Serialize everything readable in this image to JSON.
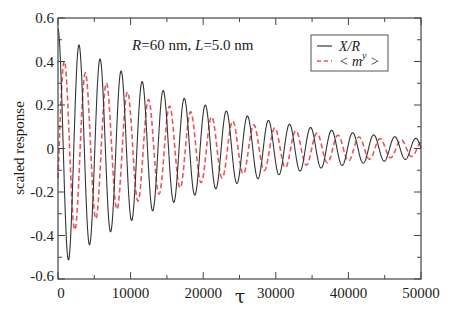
{
  "chart_data": {
    "type": "line",
    "title": "",
    "annotation": "R=60 nm, L=5.0 nm",
    "annotation_parts": {
      "r_label": "R",
      "r_value": "=60 nm, ",
      "l_label": "L",
      "l_value": "=5.0 nm"
    },
    "xlabel": "τ",
    "ylabel": "scaled response",
    "xlim": [
      0,
      50000
    ],
    "ylim": [
      -0.6,
      0.6
    ],
    "xticks": [
      0,
      10000,
      20000,
      30000,
      40000,
      50000
    ],
    "xtick_labels": [
      "0",
      "10000",
      "20000",
      "30000",
      "40000",
      "50000"
    ],
    "yticks": [
      -0.6,
      -0.4,
      -0.2,
      0,
      0.2,
      0.4,
      0.6
    ],
    "ytick_labels": [
      "-0.6",
      "-0.4",
      "-0.2",
      "0",
      "0.2",
      "0.4",
      "0.6"
    ],
    "grid": false,
    "legend_position": "upper right",
    "series": [
      {
        "name": "X/R",
        "style": "solid",
        "color": "#333333",
        "model": "damped cosine",
        "amplitude0": 0.55,
        "period": 2900,
        "decay_tau": 20000,
        "phase": 0,
        "peaks": [
          [
            0,
            0.55
          ],
          [
            2900,
            0.44
          ],
          [
            5800,
            0.36
          ],
          [
            8700,
            0.31
          ],
          [
            11600,
            0.26
          ],
          [
            14500,
            0.22
          ],
          [
            17400,
            0.18
          ],
          [
            20300,
            0.15
          ],
          [
            23200,
            0.12
          ],
          [
            29000,
            0.09
          ],
          [
            40600,
            0.05
          ],
          [
            49300,
            0.03
          ]
        ],
        "troughs": [
          [
            1450,
            -0.48
          ],
          [
            4350,
            -0.4
          ],
          [
            7250,
            -0.33
          ],
          [
            10150,
            -0.28
          ],
          [
            13050,
            -0.23
          ],
          [
            15950,
            -0.19
          ],
          [
            21750,
            -0.14
          ],
          [
            30450,
            -0.08
          ],
          [
            41950,
            -0.04
          ]
        ]
      },
      {
        "name": "<m^y>",
        "style": "dashed",
        "color": "#e8565a",
        "model": "damped cosine",
        "amplitude0": 0.42,
        "period": 2900,
        "decay_tau": 20000,
        "phase": -1.9,
        "peaks": [
          [
            1900,
            0.38
          ],
          [
            4800,
            0.31
          ],
          [
            7700,
            0.26
          ],
          [
            10600,
            0.22
          ],
          [
            13500,
            0.19
          ],
          [
            19300,
            0.13
          ],
          [
            28000,
            0.08
          ],
          [
            40000,
            0.04
          ]
        ],
        "troughs": [
          [
            500,
            -0.4
          ],
          [
            3350,
            -0.34
          ],
          [
            6250,
            -0.29
          ],
          [
            9150,
            -0.24
          ],
          [
            12050,
            -0.2
          ],
          [
            17850,
            -0.14
          ],
          [
            26500,
            -0.09
          ],
          [
            38000,
            -0.05
          ]
        ]
      }
    ]
  },
  "legend": {
    "items": [
      {
        "label": "X/R",
        "style": "solid",
        "color": "#333333"
      },
      {
        "label": "< m",
        "superscript": "y",
        "label_suffix": " >",
        "style": "dashed",
        "color": "#e8565a"
      }
    ]
  }
}
